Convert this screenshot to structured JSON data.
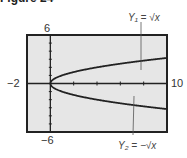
{
  "figure": {
    "title": "Figure 24"
  },
  "window": {
    "ymax_label": "6",
    "ymin_label": "−6",
    "xmin_label": "−2",
    "xmax_label": "10"
  },
  "annotations": {
    "y1": "Y₁ = √x",
    "y2": "Y₂ = −√x"
  },
  "colors": {
    "screen_bg": "#e6e6e6",
    "frame": "#222222",
    "curve": "#222222"
  },
  "chart_data": {
    "type": "line",
    "title": "Figure 24",
    "xlabel": "",
    "ylabel": "",
    "xlim": [
      -2,
      10
    ],
    "ylim": [
      -6,
      6
    ],
    "x_tick_step": 2,
    "y_tick_step": 1,
    "grid": false,
    "legend": "annotations with arrows",
    "series": [
      {
        "name": "Y1 = √x",
        "x": [
          0,
          1,
          2,
          3,
          4,
          5,
          6,
          7,
          8,
          9,
          10
        ],
        "values": [
          0,
          1,
          1.414,
          1.732,
          2,
          2.236,
          2.449,
          2.646,
          2.828,
          3,
          3.162
        ]
      },
      {
        "name": "Y2 = −√x",
        "x": [
          0,
          1,
          2,
          3,
          4,
          5,
          6,
          7,
          8,
          9,
          10
        ],
        "values": [
          0,
          -1,
          -1.414,
          -1.732,
          -2,
          -2.236,
          -2.449,
          -2.646,
          -2.828,
          -3,
          -3.162
        ]
      }
    ]
  }
}
